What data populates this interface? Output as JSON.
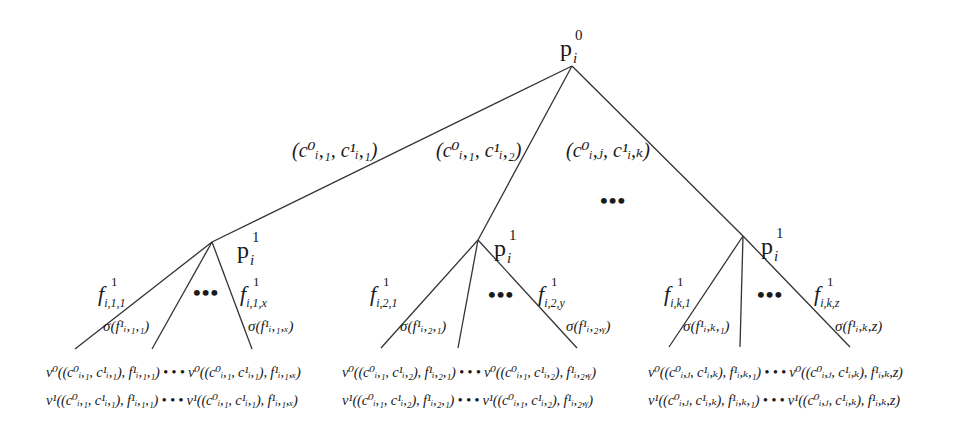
{
  "root": {
    "label": "p",
    "sub": "i",
    "sup": "0"
  },
  "top_edges": [
    {
      "label": "(c⁰ᵢ,₁, c¹ᵢ,₁)"
    },
    {
      "label": "(c⁰ᵢ,₁, c¹ᵢ,₂)"
    },
    {
      "label": "(c⁰ᵢ,ⱼ, c¹ᵢ,ₖ)"
    }
  ],
  "top_ellipsis": "•••",
  "subtrees": [
    {
      "node": {
        "label": "p",
        "sub": "i",
        "sup": "1"
      },
      "left_edge": {
        "label": "f",
        "sup": "1",
        "sub": "i,1,1"
      },
      "right_edge": {
        "label": "f",
        "sup": "1",
        "sub": "i,1,x"
      },
      "left_sigma": "σ(f¹ᵢ,₁,₁)",
      "right_sigma": "σ(f¹ᵢ,₁,ₓ)",
      "ellipsis": "•••",
      "leaf_row_0": "ν⁰((c⁰ᵢ,₁, c¹ᵢ,₁), f¹ᵢ,₁,₁) • • • ν⁰((c⁰ᵢ,₁, c¹ᵢ,₁), f¹ᵢ,₁,ₓ)",
      "leaf_row_1": "ν¹((c⁰ᵢ,₁, c¹ᵢ,₁), f¹ᵢ,₁,₁) • • • ν¹((c⁰ᵢ,₁, c¹ᵢ,₁), f¹ᵢ,₁,ₓ)"
    },
    {
      "node": {
        "label": "p",
        "sub": "i",
        "sup": "1"
      },
      "left_edge": {
        "label": "f",
        "sup": "1",
        "sub": "i,2,1"
      },
      "right_edge": {
        "label": "f",
        "sup": "1",
        "sub": "i,2,y"
      },
      "left_sigma": "σ(f¹ᵢ,₂,₁)",
      "right_sigma": "σ(f¹ᵢ,₂,ᵧ)",
      "ellipsis": "•••",
      "leaf_row_0": "ν⁰((c⁰ᵢ,₁, c¹ᵢ,₂), f¹ᵢ,₂,₁) • • • ν⁰((c⁰ᵢ,₁, c¹ᵢ,₂), f¹ᵢ,₂,ᵧ)",
      "leaf_row_1": "ν¹((c⁰ᵢ,₁, c¹ᵢ,₂), f¹ᵢ,₂,₁) • • • ν¹((c⁰ᵢ,₁, c¹ᵢ,₂), f¹ᵢ,₂,ᵧ)"
    },
    {
      "node": {
        "label": "p",
        "sub": "i",
        "sup": "1"
      },
      "left_edge": {
        "label": "f",
        "sup": "1",
        "sub": "i,k,1"
      },
      "right_edge": {
        "label": "f",
        "sup": "1",
        "sub": "i,k,z"
      },
      "left_sigma": "σ(f¹ᵢ,ₖ,₁)",
      "right_sigma": "σ(f¹ᵢ,ₖ,z)",
      "ellipsis": "•••",
      "leaf_row_0": "ν⁰((c⁰ᵢ,ⱼ, c¹ᵢ,ₖ), f¹ᵢ,ₖ,₁) • • • ν⁰((c⁰ᵢ,ⱼ, c¹ᵢ,ₖ), f¹ᵢ,ₖ,z)",
      "leaf_row_1": "ν¹((c⁰ᵢ,ⱼ, c¹ᵢ,ₖ), f¹ᵢ,ₖ,₁) • • • ν¹((c⁰ᵢ,ⱼ, c¹ᵢ,ₖ), f¹ᵢ,ₖ,z)"
    }
  ]
}
